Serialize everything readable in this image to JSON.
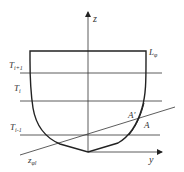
{
  "diagram": {
    "axes": {
      "z_label": "z",
      "y_label": "y"
    },
    "labels": {
      "deck_line": "L",
      "deck_line_sub": "φ",
      "waterline_upper": "T",
      "waterline_upper_sub": "i+1",
      "waterline_mid": "T",
      "waterline_mid_sub": "i",
      "waterline_lower": "T",
      "waterline_lower_sub": "i-1",
      "inclined_waterline": "z",
      "inclined_waterline_sub": "φl",
      "point_a_prime": "A′",
      "point_a": "A"
    },
    "colors": {
      "stroke": "#222222",
      "text": "#333333"
    }
  }
}
